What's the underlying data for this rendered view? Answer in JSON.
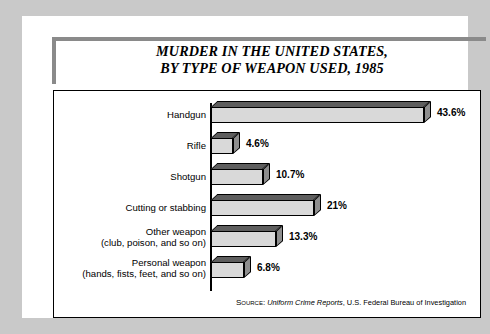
{
  "title": {
    "line1": "MURDER IN THE UNITED STATES,",
    "line2": "BY TYPE OF WEAPON USED, 1985"
  },
  "source": {
    "prefix": "Source:",
    "italic": "Uniform Crime Reports",
    "rest": ", U.S. Federal Bureau of Investigation"
  },
  "colors": {
    "page_background": "#c9c9c9",
    "card_background": "#ffffff",
    "rule": "#8a8a8a",
    "bar_front": "#d9d9d9",
    "bar_top": "#5e5e5e",
    "bar_side": "#8e8e8e",
    "outline": "#000000"
  },
  "chart_data": {
    "type": "bar",
    "orientation": "horizontal",
    "title": "MURDER IN THE UNITED STATES, BY TYPE OF WEAPON USED, 1985",
    "xlabel": "",
    "ylabel": "",
    "xlim": [
      0,
      45
    ],
    "grid": false,
    "legend": null,
    "categories": [
      "Handgun",
      "Rifle",
      "Shotgun",
      "Cutting or stabbing",
      "Other weapon (club, poison, and so on)",
      "Personal weapon (hands, fists, feet, and so on)"
    ],
    "values": [
      43.6,
      4.6,
      10.7,
      21,
      13.3,
      6.8
    ],
    "value_labels": [
      "43.6%",
      "4.6%",
      "10.7%",
      "21%",
      "13.3%",
      "6.8%"
    ],
    "rows": [
      {
        "label_line1": "Handgun",
        "label_line2": "",
        "value": 43.6,
        "value_label": "43.6%"
      },
      {
        "label_line1": "Rifle",
        "label_line2": "",
        "value": 4.6,
        "value_label": "4.6%"
      },
      {
        "label_line1": "Shotgun",
        "label_line2": "",
        "value": 10.7,
        "value_label": "10.7%"
      },
      {
        "label_line1": "Cutting or stabbing",
        "label_line2": "",
        "value": 21,
        "value_label": "21%"
      },
      {
        "label_line1": "Other weapon",
        "label_line2": "(club, poison, and so on)",
        "value": 13.3,
        "value_label": "13.3%"
      },
      {
        "label_line1": "Personal weapon",
        "label_line2": "(hands, fists, feet, and so on)",
        "value": 6.8,
        "value_label": "6.8%"
      }
    ]
  }
}
